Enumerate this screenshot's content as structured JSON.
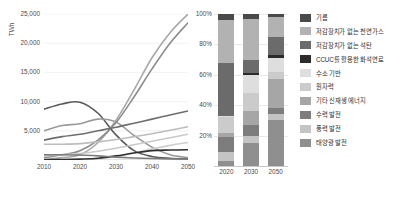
{
  "chart_data": [
    {
      "type": "line",
      "title": "",
      "xlabel": "",
      "ylabel": "TWh",
      "xlim": [
        2010,
        2050
      ],
      "ylim": [
        0,
        25000
      ],
      "grid": true,
      "legend_position": "none",
      "xticks": [
        "2010",
        "2020",
        "2030",
        "2040",
        "2050"
      ],
      "yticks": [
        "5,000",
        "10,000",
        "15,000",
        "20,000",
        "25,000"
      ],
      "x": [
        2010,
        2015,
        2020,
        2025,
        2030,
        2035,
        2040,
        2045,
        2050
      ],
      "series": [
        {
          "name": "저감장치가 없는 석탄",
          "color": "#595959",
          "values": [
            8700,
            9600,
            9900,
            8000,
            4300,
            1600,
            600,
            300,
            200
          ]
        },
        {
          "name": "저감장치가 없는 천연가스",
          "color": "#9a9a9a",
          "values": [
            5000,
            5900,
            6200,
            7000,
            6500,
            4200,
            2200,
            900,
            400
          ]
        },
        {
          "name": "태양광 발전",
          "color": "#a8a8a8",
          "values": [
            100,
            400,
            900,
            3000,
            6800,
            12000,
            17500,
            21800,
            25000
          ]
        },
        {
          "name": "풍력 발전",
          "color": "#8d8d8d",
          "values": [
            400,
            900,
            1600,
            3400,
            6400,
            10800,
            15600,
            20000,
            23500
          ]
        },
        {
          "name": "수력 발전",
          "color": "#6e6e6e",
          "values": [
            3400,
            4000,
            4400,
            5000,
            5600,
            6300,
            7000,
            7700,
            8400
          ]
        },
        {
          "name": "원자력",
          "color": "#bdbdbd",
          "values": [
            2700,
            2700,
            2800,
            3100,
            3500,
            4000,
            4500,
            5100,
            5700
          ]
        },
        {
          "name": "기타 신재생 에너지",
          "color": "#c9c9c9",
          "values": [
            700,
            900,
            1100,
            1500,
            2000,
            2600,
            3200,
            3800,
            4400
          ]
        },
        {
          "name": "수소 기반",
          "color": "#cfcfcf",
          "values": [
            0,
            0,
            50,
            200,
            600,
            1200,
            1900,
            2500,
            3000
          ]
        },
        {
          "name": "CCUC를 활용한 화석연료",
          "color": "#2f2f2f",
          "values": [
            50,
            80,
            150,
            300,
            700,
            1200,
            1600,
            1700,
            1750
          ]
        },
        {
          "name": "기름",
          "color": "#7b7b7b",
          "values": [
            900,
            900,
            850,
            700,
            500,
            350,
            250,
            200,
            180
          ]
        }
      ]
    },
    {
      "type": "bar",
      "subtype": "stacked-100",
      "title": "",
      "xlabel": "",
      "ylabel": "",
      "grid": true,
      "legend_position": "right",
      "categories": [
        "2020",
        "2030",
        "2050"
      ],
      "yticks": [
        "20%",
        "40%",
        "60%",
        "80%",
        "100%"
      ],
      "ylim": [
        0,
        100
      ],
      "series": [
        {
          "name": "태양광 발전",
          "color": "#8f8f8f",
          "values": [
            3,
            15,
            30
          ]
        },
        {
          "name": "풍력 발전",
          "color": "#c4c4c4",
          "values": [
            6,
            5,
            4
          ]
        },
        {
          "name": "수력 발전",
          "color": "#7d7d7d",
          "values": [
            10,
            7,
            4
          ]
        },
        {
          "name": "기타 신재생 에너지",
          "color": "#a6a6a6",
          "values": [
            3,
            9,
            19
          ]
        },
        {
          "name": "원자력",
          "color": "#cbcbcb",
          "values": [
            10,
            12,
            5
          ]
        },
        {
          "name": "수소 기반",
          "color": "#dedede",
          "values": [
            1,
            12,
            9
          ]
        },
        {
          "name": "CCUC를 활용한 화석연료",
          "color": "#2b2b2b",
          "values": [
            0,
            1,
            2
          ]
        },
        {
          "name": "저감장치가 없는 석탄",
          "color": "#6b6b6b",
          "values": [
            35,
            9,
            12
          ]
        },
        {
          "name": "저감장치가 없는 천연가스",
          "color": "#b2b2b2",
          "values": [
            28,
            27,
            13
          ]
        },
        {
          "name": "기름",
          "color": "#4a4a4a",
          "values": [
            4,
            3,
            2
          ]
        }
      ]
    }
  ],
  "line_chart": {
    "ylabel": "TWh",
    "yticks": [
      "25,000",
      "20,000",
      "15,000",
      "10,000",
      "5,000"
    ],
    "xticks": [
      "2010",
      "2020",
      "2030",
      "2040",
      "2050"
    ]
  },
  "bar_chart": {
    "yticks": [
      "100%",
      "80%",
      "60%",
      "40%",
      "20%"
    ],
    "xticks": [
      "2020",
      "2030",
      "2050"
    ]
  },
  "legend": {
    "items": [
      {
        "label": "기름",
        "color": "#4a4a4a"
      },
      {
        "label": "저감장치가 없는 천연가스",
        "color": "#b2b2b2"
      },
      {
        "label": "저감장치가 없는 석탄",
        "color": "#6b6b6b"
      },
      {
        "label": "CCUC를 활용한 화석연료",
        "color": "#2b2b2b"
      },
      {
        "label": "수소 기반",
        "color": "#dedede"
      },
      {
        "label": "원자력",
        "color": "#cbcbcb"
      },
      {
        "label": "기타 신재생 에너지",
        "color": "#a6a6a6"
      },
      {
        "label": "수력 발전",
        "color": "#7d7d7d"
      },
      {
        "label": "풍력 발전",
        "color": "#c4c4c4"
      },
      {
        "label": "태양광 발전",
        "color": "#8f8f8f"
      }
    ]
  }
}
